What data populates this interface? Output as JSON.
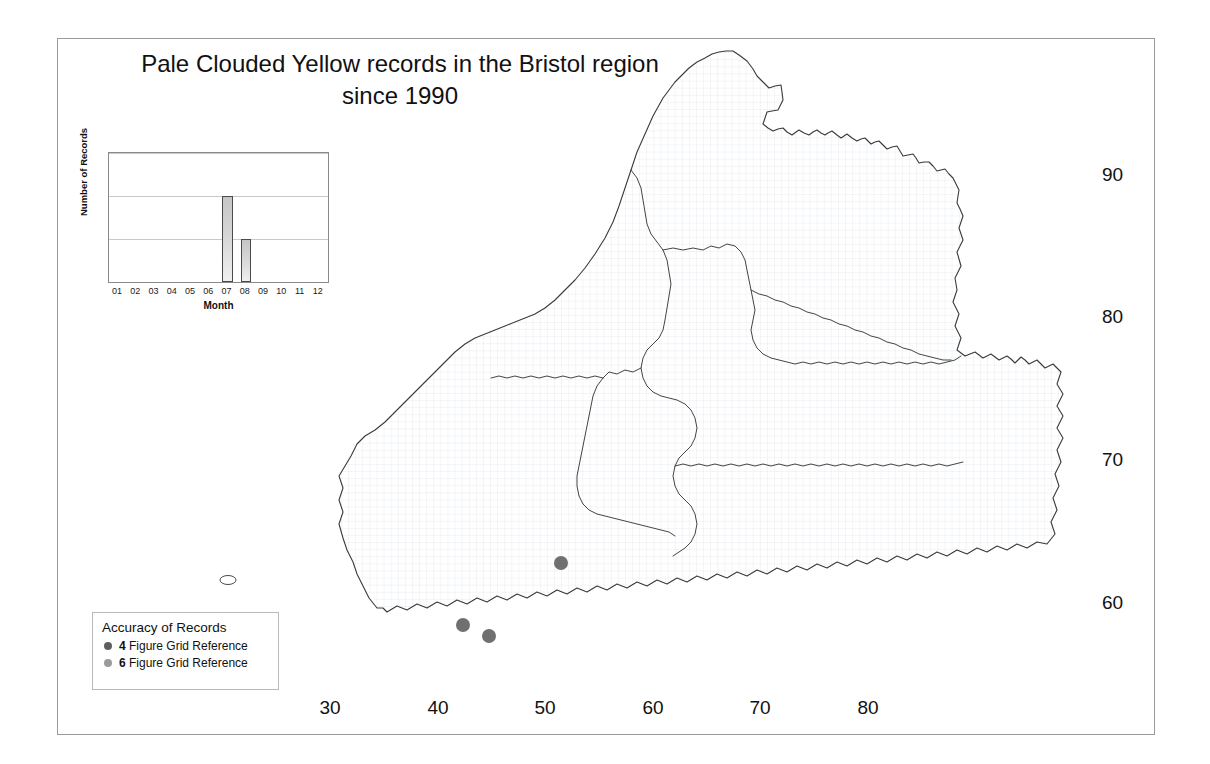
{
  "figure": {
    "title_line_1": "Pale Clouded Yellow records in the Bristol region",
    "title_line_2": "since 1990"
  },
  "inset_chart": {
    "ylabel": "Number of Records",
    "xlabel": "Month"
  },
  "chart_data": {
    "type": "bar",
    "title": "Pale Clouded Yellow records in the Bristol region since 1990",
    "categories": [
      "01",
      "02",
      "03",
      "04",
      "05",
      "06",
      "07",
      "08",
      "09",
      "10",
      "11",
      "12"
    ],
    "values": [
      0,
      0,
      0,
      0,
      0,
      0,
      2,
      1,
      0,
      0,
      0,
      0
    ],
    "xlabel": "Month",
    "ylabel": "Number of Records",
    "ylim": [
      0,
      3
    ],
    "yticks": [
      0,
      1,
      2,
      3
    ],
    "grid": true,
    "legend": false
  },
  "map": {
    "x_axis_ticks": [
      "30",
      "40",
      "50",
      "60",
      "70",
      "80"
    ],
    "y_axis_ticks": [
      "90",
      "80",
      "70",
      "60"
    ],
    "records": [
      {
        "easting": "46.5",
        "northing": "62.5",
        "accuracy": "6 Figure Grid Reference"
      },
      {
        "easting": "40.3",
        "northing": "58.2",
        "accuracy": "6 Figure Grid Reference"
      },
      {
        "easting": "42.0",
        "northing": "57.5",
        "accuracy": "6 Figure Grid Reference"
      }
    ],
    "record_count": "3"
  },
  "legend": {
    "title": "Accuracy of Records",
    "items": [
      {
        "prefix": "4",
        "label": " Figure Grid Reference",
        "color": "#5f5f5f"
      },
      {
        "prefix": "6",
        "label": " Figure Grid Reference",
        "color": "#9b9b9b"
      }
    ]
  },
  "colors": {
    "record_marker": "#707070",
    "map_outline": "#3a3a3a",
    "grid_fine": "#d9dde6",
    "frame": "#9a9a9a"
  }
}
